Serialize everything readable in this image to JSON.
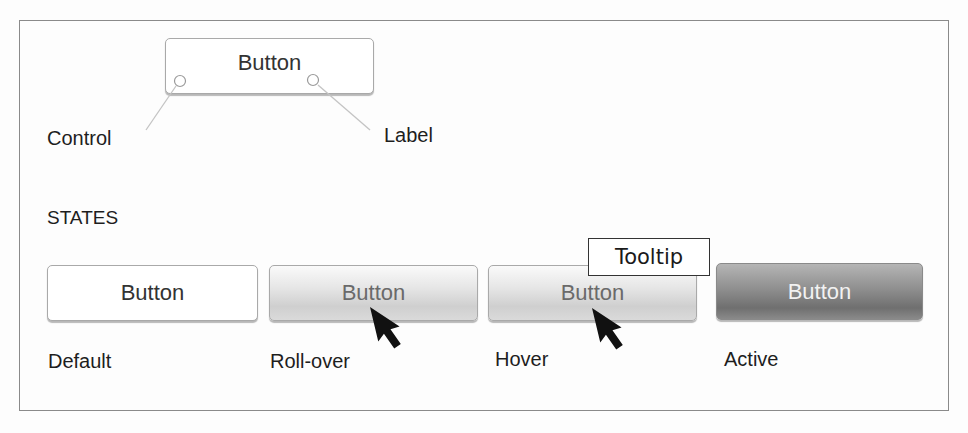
{
  "anatomy": {
    "button_label": "Button",
    "control_callout": "Control",
    "label_callout": "Label"
  },
  "states_heading": "STATES",
  "states": [
    {
      "key": "default",
      "button_label": "Button",
      "caption": "Default"
    },
    {
      "key": "rollover",
      "button_label": "Button",
      "caption": "Roll-over"
    },
    {
      "key": "hover",
      "button_label": "Button",
      "caption": "Hover",
      "tooltip": "Tooltip"
    },
    {
      "key": "active",
      "button_label": "Button",
      "caption": "Active"
    }
  ],
  "icons": {
    "cursor": "arrow-cursor-icon",
    "callout_marker": "circle-marker-icon"
  },
  "colors": {
    "frame_border": "#8a8a8a",
    "callout_line": "#bdbdbd",
    "active_button": "#7a7a7a",
    "text": "#1e1e1e"
  }
}
